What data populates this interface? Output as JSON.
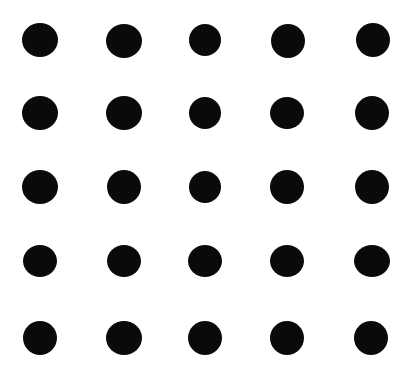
{
  "figure": {
    "background_color": "#ffffff",
    "dot_color": "#0a0a0a",
    "width": 411,
    "height": 373,
    "rows": 5,
    "columns": 5,
    "total_dots": 25
  },
  "chart_data": {
    "type": "scatter",
    "title": "",
    "subtitle": "",
    "xlabel": "",
    "ylabel": "",
    "grid": false,
    "legend": null,
    "axis_visible": false,
    "tick_labels_visible": false,
    "xlim": [
      0,
      411
    ],
    "ylim": [
      0,
      373
    ],
    "marker": "circle",
    "marker_color": "#0a0a0a",
    "background_color": "#ffffff",
    "column_centers_x": [
      40,
      124,
      205,
      287,
      372
    ],
    "row_centers_y": [
      40,
      113,
      187,
      261,
      338
    ],
    "points": [
      {
        "id": "r1c1",
        "row": 1,
        "col": 1,
        "cx": 40,
        "cy": 40,
        "rx": 18,
        "ry": 17
      },
      {
        "id": "r1c2",
        "row": 1,
        "col": 2,
        "cx": 124,
        "cy": 41,
        "rx": 18,
        "ry": 17
      },
      {
        "id": "r1c3",
        "row": 1,
        "col": 3,
        "cx": 205,
        "cy": 40,
        "rx": 16,
        "ry": 16
      },
      {
        "id": "r1c4",
        "row": 1,
        "col": 4,
        "cx": 288,
        "cy": 41,
        "rx": 17,
        "ry": 17
      },
      {
        "id": "r1c5",
        "row": 1,
        "col": 5,
        "cx": 373,
        "cy": 40,
        "rx": 17,
        "ry": 17
      },
      {
        "id": "r2c1",
        "row": 2,
        "col": 1,
        "cx": 40,
        "cy": 113,
        "rx": 18,
        "ry": 17
      },
      {
        "id": "r2c2",
        "row": 2,
        "col": 2,
        "cx": 124,
        "cy": 113,
        "rx": 18,
        "ry": 17
      },
      {
        "id": "r2c3",
        "row": 2,
        "col": 3,
        "cx": 205,
        "cy": 113,
        "rx": 16,
        "ry": 16
      },
      {
        "id": "r2c4",
        "row": 2,
        "col": 4,
        "cx": 287,
        "cy": 113,
        "rx": 17,
        "ry": 16
      },
      {
        "id": "r2c5",
        "row": 2,
        "col": 5,
        "cx": 372,
        "cy": 113,
        "rx": 17,
        "ry": 17
      },
      {
        "id": "r3c1",
        "row": 3,
        "col": 1,
        "cx": 40,
        "cy": 187,
        "rx": 18,
        "ry": 17
      },
      {
        "id": "r3c2",
        "row": 3,
        "col": 2,
        "cx": 124,
        "cy": 187,
        "rx": 17,
        "ry": 17
      },
      {
        "id": "r3c3",
        "row": 3,
        "col": 3,
        "cx": 205,
        "cy": 187,
        "rx": 16,
        "ry": 16
      },
      {
        "id": "r3c4",
        "row": 3,
        "col": 4,
        "cx": 287,
        "cy": 187,
        "rx": 17,
        "ry": 17
      },
      {
        "id": "r3c5",
        "row": 3,
        "col": 5,
        "cx": 372,
        "cy": 187,
        "rx": 17,
        "ry": 17
      },
      {
        "id": "r4c1",
        "row": 4,
        "col": 1,
        "cx": 40,
        "cy": 261,
        "rx": 17,
        "ry": 16
      },
      {
        "id": "r4c2",
        "row": 4,
        "col": 2,
        "cx": 124,
        "cy": 261,
        "rx": 17,
        "ry": 16
      },
      {
        "id": "r4c3",
        "row": 4,
        "col": 3,
        "cx": 205,
        "cy": 261,
        "rx": 17,
        "ry": 16
      },
      {
        "id": "r4c4",
        "row": 4,
        "col": 4,
        "cx": 287,
        "cy": 261,
        "rx": 17,
        "ry": 16
      },
      {
        "id": "r4c5",
        "row": 4,
        "col": 5,
        "cx": 372,
        "cy": 261,
        "rx": 18,
        "ry": 16
      },
      {
        "id": "r5c1",
        "row": 5,
        "col": 1,
        "cx": 40,
        "cy": 338,
        "rx": 17,
        "ry": 17
      },
      {
        "id": "r5c2",
        "row": 5,
        "col": 2,
        "cx": 124,
        "cy": 338,
        "rx": 18,
        "ry": 17
      },
      {
        "id": "r5c3",
        "row": 5,
        "col": 3,
        "cx": 205,
        "cy": 338,
        "rx": 17,
        "ry": 17
      },
      {
        "id": "r5c4",
        "row": 5,
        "col": 4,
        "cx": 287,
        "cy": 338,
        "rx": 17,
        "ry": 17
      },
      {
        "id": "r5c5",
        "row": 5,
        "col": 5,
        "cx": 371,
        "cy": 338,
        "rx": 17,
        "ry": 17
      }
    ]
  }
}
